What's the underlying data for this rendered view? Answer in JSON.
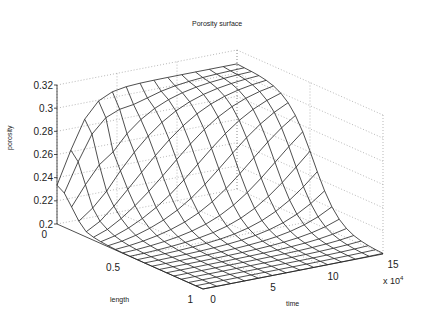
{
  "chart_data": {
    "type": "surface",
    "title": "Porosity surface",
    "xlabel": "length",
    "ylabel": "time",
    "zlabel": "porosity",
    "x_ticks": [
      "0",
      "0.5",
      "1"
    ],
    "x_range": [
      0,
      1
    ],
    "y_ticks": [
      "0",
      "5",
      "10",
      "15"
    ],
    "y_range": [
      0,
      150000
    ],
    "y_multiplier": "x 10^4",
    "z_ticks": [
      "0.2",
      "0.22",
      "0.24",
      "0.26",
      "0.28",
      "0.3",
      "0.32"
    ],
    "z_range": [
      0.2,
      0.32
    ],
    "grid": true,
    "mesh": {
      "length_samples": 21,
      "time_samples": 14,
      "description": "Porosity rises from 0.2 toward ~0.30-0.31 near length=0 and spreads to larger lengths as time increases; at length near 1 porosity remains ~0.2; surface front moves inward with time (wave-like profile)",
      "max_porosity": 0.31,
      "min_porosity": 0.2
    }
  },
  "labels": {
    "title": "Porosity surface",
    "zlabel": "porosity",
    "xlabel": "length",
    "ylabel": "time",
    "multiplier_base": "x 10",
    "multiplier_exp": "4"
  }
}
